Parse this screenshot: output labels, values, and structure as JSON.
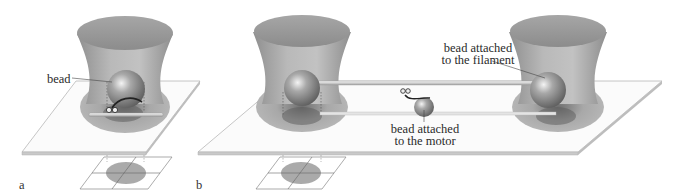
{
  "figure": {
    "panels": [
      {
        "id": "a",
        "letter": "a",
        "labels": {
          "bead": "bead"
        }
      },
      {
        "id": "b",
        "letter": "b",
        "labels": {
          "bead_filament_line1": "bead attached",
          "bead_filament_line2": "to the filament",
          "bead_motor_line1": "bead attached",
          "bead_motor_line2": "to the motor"
        }
      }
    ],
    "colors": {
      "trap_fill": "#a9a9a9",
      "trap_top": "#9e9e9e",
      "bead": "#8a8a8a",
      "slide_edge": "#bdbdbd",
      "focus_spot": "#9a9a9a",
      "text": "#2a2a2a"
    }
  }
}
